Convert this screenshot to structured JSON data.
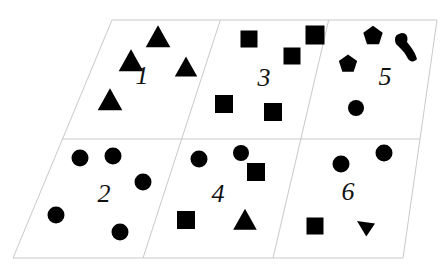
{
  "figure": {
    "background_color": "#ffffff",
    "shape_color": "#000000",
    "grid_line_color": "#c9c9c9",
    "outline": {
      "top_left": [
        112,
        20
      ],
      "top_right": [
        437,
        20
      ],
      "bottom_right": [
        403,
        258
      ],
      "bottom_left": [
        13,
        258
      ]
    },
    "rows": 2,
    "columns": 3
  },
  "chart_data": {
    "type": "diagram",
    "cells": [
      {
        "label": "1",
        "label_x": 142,
        "label_y": 84,
        "row": 0,
        "column": 0,
        "shape_counts": {
          "triangle": 4
        },
        "total_shapes": 4,
        "shapes": [
          {
            "kind": "triangle",
            "x": 158,
            "y": 38,
            "size": 22
          },
          {
            "kind": "triangle",
            "x": 131,
            "y": 62,
            "size": 22
          },
          {
            "kind": "triangle",
            "x": 186,
            "y": 68,
            "size": 20
          },
          {
            "kind": "triangle",
            "x": 110,
            "y": 101,
            "size": 22
          }
        ]
      },
      {
        "label": "3",
        "label_x": 264,
        "label_y": 86,
        "row": 0,
        "column": 1,
        "shape_counts": {
          "square": 5
        },
        "total_shapes": 5,
        "shapes": [
          {
            "kind": "square",
            "x": 249,
            "y": 39,
            "size": 17
          },
          {
            "kind": "square",
            "x": 292,
            "y": 56,
            "size": 17
          },
          {
            "kind": "square",
            "x": 315,
            "y": 35,
            "size": 19
          },
          {
            "kind": "square",
            "x": 224,
            "y": 104,
            "size": 18
          },
          {
            "kind": "square",
            "x": 273,
            "y": 112,
            "size": 18
          }
        ]
      },
      {
        "label": "5",
        "label_x": 385,
        "label_y": 85,
        "row": 0,
        "column": 2,
        "shape_counts": {
          "pentagon": 2,
          "circle": 1,
          "blob": 1
        },
        "total_shapes": 4,
        "shapes": [
          {
            "kind": "pentagon",
            "x": 373,
            "y": 36,
            "size": 17
          },
          {
            "kind": "pentagon",
            "x": 348,
            "y": 64,
            "size": 16
          },
          {
            "kind": "blob",
            "x": 408,
            "y": 48,
            "size": 24
          },
          {
            "kind": "circle",
            "x": 356,
            "y": 108,
            "size": 16
          }
        ]
      },
      {
        "label": "2",
        "label_x": 104,
        "label_y": 202,
        "row": 1,
        "column": 0,
        "shape_counts": {
          "circle": 5
        },
        "total_shapes": 5,
        "shapes": [
          {
            "kind": "circle",
            "x": 80,
            "y": 158,
            "size": 17
          },
          {
            "kind": "circle",
            "x": 113,
            "y": 156,
            "size": 17
          },
          {
            "kind": "circle",
            "x": 143,
            "y": 182,
            "size": 17
          },
          {
            "kind": "circle",
            "x": 56,
            "y": 215,
            "size": 17
          },
          {
            "kind": "circle",
            "x": 120,
            "y": 232,
            "size": 17
          }
        ]
      },
      {
        "label": "4",
        "label_x": 218,
        "label_y": 202,
        "row": 1,
        "column": 1,
        "shape_counts": {
          "circle": 2,
          "square": 2,
          "triangle": 1
        },
        "total_shapes": 5,
        "shapes": [
          {
            "kind": "circle",
            "x": 199,
            "y": 159,
            "size": 17
          },
          {
            "kind": "circle",
            "x": 241,
            "y": 153,
            "size": 16
          },
          {
            "kind": "square",
            "x": 256,
            "y": 172,
            "size": 18
          },
          {
            "kind": "square",
            "x": 186,
            "y": 220,
            "size": 18
          },
          {
            "kind": "triangle",
            "x": 245,
            "y": 221,
            "size": 21
          }
        ]
      },
      {
        "label": "6",
        "label_x": 348,
        "label_y": 200,
        "row": 1,
        "column": 2,
        "shape_counts": {
          "circle": 2,
          "square": 1,
          "triangle-down": 1
        },
        "total_shapes": 4,
        "shapes": [
          {
            "kind": "circle",
            "x": 341,
            "y": 164,
            "size": 17
          },
          {
            "kind": "circle",
            "x": 384,
            "y": 153,
            "size": 17
          },
          {
            "kind": "square",
            "x": 315,
            "y": 226,
            "size": 17
          },
          {
            "kind": "triangle-down",
            "x": 366,
            "y": 228,
            "size": 15
          }
        ]
      }
    ]
  }
}
